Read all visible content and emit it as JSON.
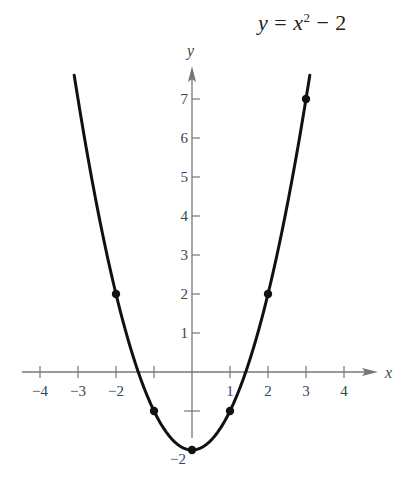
{
  "title": {
    "lhs": "y",
    "eq": "=",
    "var": "x",
    "exp": "2",
    "rest": "− 2"
  },
  "axes": {
    "xlabel": "x",
    "ylabel": "y",
    "x_ticks": [
      -4,
      -3,
      -2,
      -1,
      1,
      2,
      3,
      4
    ],
    "x_tick_labels": [
      "−4",
      "−3",
      "−2",
      "",
      "1",
      "2",
      "3",
      "4"
    ],
    "y_ticks": [
      1,
      2,
      3,
      4,
      5,
      6,
      7,
      -1
    ],
    "y_tick_labels": [
      "1",
      "2",
      "3",
      "4",
      "5",
      "6",
      "7",
      ""
    ],
    "y_extra_label": "−2"
  },
  "colors": {
    "curve": "#111111",
    "axis": "#777777",
    "point": "#111111",
    "text": "#444444"
  },
  "chart_data": {
    "type": "line",
    "xlabel": "x",
    "ylabel": "y",
    "xlim": [
      -4.5,
      4.8
    ],
    "ylim": [
      -2.3,
      8
    ],
    "grid": false,
    "legend": "none",
    "series": [
      {
        "name": "y = x^2 − 2",
        "function": "x^2 - 2",
        "x_range": [
          -3.1,
          3.1
        ]
      }
    ],
    "points": {
      "x": [
        -2,
        -1,
        0,
        1,
        2,
        3
      ],
      "y": [
        2,
        -1,
        -2,
        -1,
        2,
        7
      ]
    }
  }
}
